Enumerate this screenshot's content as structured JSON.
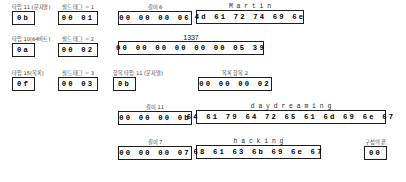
{
  "diagram": {
    "title_labels": {
      "type_11_string": "타입 11 (문자열)",
      "type_10_64bit": "타입 10(64비트)",
      "type_15_list": "타입 15(목록)",
      "field_tag_1": "필드 태그 = 1",
      "field_tag_2": "필드 태그 = 2",
      "field_tag_3": "필드 태그 = 3",
      "length_6": "길이 6",
      "value_1337": "1337",
      "item_type_11_string": "항목 타입 11 (문자열)",
      "list_items_2": "목록 항목 2",
      "length_11": "길이 11",
      "length_7": "길이 7",
      "end_of_struct": "구성의 끝"
    },
    "rows": [
      {
        "id": "row-username",
        "fields": [
          {
            "name": "type-byte",
            "caption": "타입 11 (문자열)",
            "caption_kind": "korean",
            "bytes": [
              "0b"
            ]
          },
          {
            "name": "field-tag",
            "caption": "필드 태그 = 1",
            "caption_kind": "korean",
            "bytes": [
              "00",
              "01"
            ]
          },
          {
            "name": "length",
            "caption": "길이 6",
            "caption_kind": "korean",
            "bytes": [
              "00",
              "00",
              "00",
              "06"
            ]
          },
          {
            "name": "string-value",
            "caption": "M a r t i n",
            "caption_kind": "ascii",
            "bytes": [
              "4d",
              "61",
              "72",
              "74",
              "69",
              "6e"
            ]
          }
        ]
      },
      {
        "id": "row-favorite-number",
        "fields": [
          {
            "name": "type-byte",
            "caption": "타입 10(64비트)",
            "caption_kind": "korean",
            "bytes": [
              "0a"
            ]
          },
          {
            "name": "field-tag",
            "caption": "필드 태그 = 2",
            "caption_kind": "korean",
            "bytes": [
              "00",
              "02"
            ]
          },
          {
            "name": "int64-value",
            "caption": "1337",
            "caption_kind": "num",
            "bytes": [
              "00",
              "00",
              "00",
              "00",
              "00",
              "00",
              "05",
              "39"
            ]
          }
        ]
      },
      {
        "id": "row-list-header",
        "fields": [
          {
            "name": "type-byte",
            "caption": "타입 15(목록)",
            "caption_kind": "korean",
            "bytes": [
              "0f"
            ]
          },
          {
            "name": "field-tag",
            "caption": "필드 태그 = 3",
            "caption_kind": "korean",
            "bytes": [
              "00",
              "03"
            ]
          },
          {
            "name": "item-type-byte",
            "caption": "항목 타입 11 (문자열)",
            "caption_kind": "korean",
            "bytes": [
              "0b"
            ]
          },
          {
            "name": "list-count",
            "caption": "목록 항목 2",
            "caption_kind": "korean",
            "bytes": [
              "00",
              "00",
              "00",
              "02"
            ]
          }
        ]
      },
      {
        "id": "row-interest-daydreaming",
        "fields": [
          {
            "name": "length",
            "caption": "길이 11",
            "caption_kind": "korean",
            "bytes": [
              "00",
              "00",
              "00",
              "0b"
            ]
          },
          {
            "name": "string-value",
            "caption": "d a y d r e a m i n g",
            "caption_kind": "ascii",
            "bytes": [
              "64",
              "61",
              "79",
              "64",
              "72",
              "65",
              "61",
              "6d",
              "69",
              "6e",
              "67"
            ]
          }
        ]
      },
      {
        "id": "row-interest-hacking",
        "fields": [
          {
            "name": "length",
            "caption": "길이 7",
            "caption_kind": "korean",
            "bytes": [
              "00",
              "00",
              "00",
              "07"
            ]
          },
          {
            "name": "string-value",
            "caption": "h a c k i n g",
            "caption_kind": "ascii",
            "bytes": [
              "68",
              "61",
              "63",
              "6b",
              "69",
              "6e",
              "67"
            ]
          },
          {
            "name": "end-marker",
            "caption": "구성의 끝",
            "caption_kind": "korean",
            "bytes": [
              "00"
            ]
          }
        ]
      }
    ],
    "cells": {
      "r0c0_caption": "타입 11 (문자열)",
      "r0c0_bytes": "0b",
      "r0c1_caption": "필드 태그 = 1",
      "r0c1_bytes": "00  01",
      "r0c2_caption": "길이 6",
      "r0c2_bytes": "00  00  00  06",
      "r0c3_caption": "M  a  r  t  i  n",
      "r0c3_bytes": "4d  61  72  74  69  6e",
      "r1c0_caption": "타입 10(64비트)",
      "r1c0_bytes": "0a",
      "r1c1_caption": "필드 태그 = 2",
      "r1c1_bytes": "00  02",
      "r1c2_caption": "1337",
      "r1c2_bytes": "00  00  00  00  00  00  05  39",
      "r2c0_caption": "타입 15(목록)",
      "r2c0_bytes": "0f",
      "r2c1_caption": "필드 태그 = 3",
      "r2c1_bytes": "00  03",
      "r2c2_caption": "항목 타입 11 (문자열)",
      "r2c2_bytes": "0b",
      "r2c3_caption": "목록 항목 2",
      "r2c3_bytes": "00  00  00  02",
      "r3c0_caption": "길이 11",
      "r3c0_bytes": "00  00  00  0b",
      "r3c1_caption": "d  a  y  d  r  e  a  m  i  n  g",
      "r3c1_bytes": "64  61  79  64  72  65  61  6d  69  6e  67",
      "r4c0_caption": "길이 7",
      "r4c0_bytes": "00  00  00  07",
      "r4c1_caption": "h  a  c  k  i  n  g",
      "r4c1_bytes": "68  61  63  6b  69  6e  67",
      "r4c2_caption": "구성의 끝",
      "r4c2_bytes": "00"
    }
  }
}
